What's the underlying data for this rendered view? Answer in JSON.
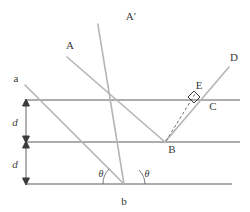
{
  "figure": {
    "colors": {
      "plane_line": "#5a5a5a",
      "ray_line": "#b0b0b0",
      "dashed_line": "#777777",
      "arrow_line": "#3a3a3a",
      "text": "#3a3a3a",
      "background": "#ffffff"
    },
    "labels": {
      "incident_ray_a": "a",
      "incident_ray_A": "A",
      "reflected_ray_A_prime": "A′",
      "reflected_ray_D": "D",
      "point_B": "B",
      "point_C": "C",
      "point_E": "E",
      "point_b": "b",
      "spacing_upper": "d",
      "spacing_lower": "d",
      "angle_left": "θ",
      "angle_right": "θ"
    },
    "geometry": {
      "planes": [
        {
          "name": "top-plane",
          "y": 100,
          "x1": 26,
          "x2": 240
        },
        {
          "name": "middle-plane",
          "y": 142,
          "x1": 26,
          "x2": 240
        },
        {
          "name": "bottom-plane",
          "y": 184,
          "x1": 26,
          "x2": 232
        }
      ],
      "spacing_arrows": {
        "x": 26,
        "upper": [
          100,
          142
        ],
        "lower": [
          142,
          184
        ]
      },
      "points": {
        "b": [
          124,
          184
        ],
        "B": [
          165,
          142
        ],
        "C": [
          207,
          100
        ],
        "E": [
          194,
          92
        ]
      },
      "incident_rays": [
        {
          "name": "ray-a",
          "from": [
            25,
            83
          ],
          "to": [
            124,
            184
          ]
        },
        {
          "name": "ray-A",
          "from": [
            66,
            55
          ],
          "to": [
            165,
            142
          ]
        }
      ],
      "reflected_rays": [
        {
          "name": "ray-A-prime",
          "from": [
            124,
            184
          ],
          "to": [
            124,
            22
          ]
        },
        {
          "name": "ray-D",
          "from": [
            165,
            142
          ],
          "to": [
            228,
            66
          ]
        }
      ],
      "dashed_segment": {
        "name": "segment-BE",
        "from": [
          165,
          142
        ],
        "to": [
          194,
          95
        ]
      },
      "right_angle_marker_at": "E",
      "angles_at_b_degrees": 45
    },
    "label_positions": {
      "a": [
        16,
        80
      ],
      "A": [
        68,
        47
      ],
      "A_prime": [
        127,
        18
      ],
      "D": [
        231,
        59
      ],
      "E": [
        196,
        87
      ],
      "C": [
        211,
        107
      ],
      "B": [
        169,
        151
      ],
      "b": [
        121,
        204
      ],
      "d_upper": [
        14,
        125
      ],
      "d_lower": [
        14,
        167
      ],
      "theta_left": [
        104,
        176
      ],
      "theta_right": [
        143,
        176
      ]
    }
  }
}
